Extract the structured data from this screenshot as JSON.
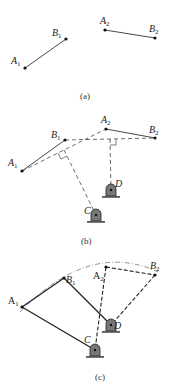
{
  "figure": {
    "panels": [
      {
        "id": "a",
        "caption": "(a)",
        "points": {
          "A1": {
            "label": "A",
            "sub": "1",
            "x": 25,
            "y": 68
          },
          "B1": {
            "label": "B",
            "sub": "1",
            "x": 66,
            "y": 39
          },
          "A2": {
            "label": "A",
            "sub": "2",
            "x": 105,
            "y": 30
          },
          "B2": {
            "label": "B",
            "sub": "2",
            "x": 155,
            "y": 38
          }
        }
      },
      {
        "id": "b",
        "caption": "(b)",
        "points": {
          "A1": {
            "label": "A",
            "sub": "1",
            "x": 22,
            "y": 171
          },
          "B1": {
            "label": "B",
            "sub": "1",
            "x": 65,
            "y": 140
          },
          "A2": {
            "label": "A",
            "sub": "2",
            "x": 106,
            "y": 129
          },
          "B2": {
            "label": "B",
            "sub": "2",
            "x": 155,
            "y": 138
          },
          "C": {
            "label": "C",
            "x": 96,
            "y": 215
          },
          "D": {
            "label": "D",
            "x": 111,
            "y": 190
          }
        }
      },
      {
        "id": "c",
        "caption": "(c)",
        "points": {
          "A1": {
            "label": "A",
            "sub": "1",
            "x": 22,
            "y": 307
          },
          "B1": {
            "label": "B",
            "sub": "1",
            "x": 64,
            "y": 278
          },
          "A2": {
            "label": "A",
            "sub": "2",
            "x": 106,
            "y": 267
          },
          "B2": {
            "label": "B",
            "sub": "2",
            "x": 155,
            "y": 275
          },
          "C": {
            "label": "C",
            "x": 95,
            "y": 350
          },
          "D": {
            "label": "D",
            "x": 111,
            "y": 325
          }
        }
      }
    ]
  },
  "labels": {
    "a_caption": "(a)",
    "b_caption": "(b)",
    "c_caption": "(c)",
    "A": "A",
    "B": "B",
    "C": "C",
    "D": "D",
    "s1": "1",
    "s2": "2"
  }
}
